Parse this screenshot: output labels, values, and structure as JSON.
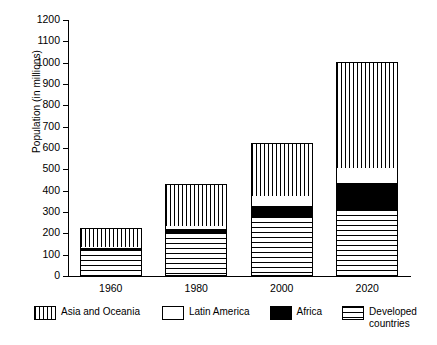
{
  "chart_data": {
    "type": "bar",
    "stacked": true,
    "title": "",
    "xlabel": "",
    "ylabel": "Population (in millions)",
    "categories": [
      "1960",
      "1980",
      "2000",
      "2020"
    ],
    "ylim": [
      0,
      1200
    ],
    "ytick_step": 100,
    "yticks": [
      0,
      100,
      200,
      300,
      400,
      500,
      600,
      700,
      800,
      900,
      1000,
      1100,
      1200
    ],
    "grid": false,
    "legend_position": "bottom",
    "series": [
      {
        "name": "Developed countries",
        "pattern": "horizontal-lines",
        "values": [
          120,
          200,
          275,
          310
        ]
      },
      {
        "name": "Africa",
        "pattern": "solid-black",
        "values": [
          10,
          20,
          55,
          125
        ]
      },
      {
        "name": "Latin America",
        "pattern": "white-empty",
        "values": [
          5,
          15,
          45,
          70
        ]
      },
      {
        "name": "Asia and Oceania",
        "pattern": "vertical-lines",
        "values": [
          90,
          195,
          250,
          500
        ]
      }
    ],
    "totals": [
      225,
      430,
      625,
      1005
    ]
  },
  "axis": {
    "y_title": "Population (in millions)",
    "y_tick_labels": [
      "1200",
      "1100",
      "1000",
      "900",
      "800",
      "700",
      "600",
      "500",
      "400",
      "300",
      "200",
      "100",
      "0"
    ],
    "x_tick_labels": [
      "1960",
      "1980",
      "2000",
      "2020"
    ]
  },
  "legend": {
    "items": [
      {
        "label": "Asia and Oceania",
        "pattern": "vertical-lines"
      },
      {
        "label": "Latin America",
        "pattern": "white-empty"
      },
      {
        "label": "Africa",
        "pattern": "solid-black"
      },
      {
        "label": "Developed\ncountries",
        "pattern": "horizontal-lines"
      }
    ]
  },
  "colors": {
    "ink": "#000000",
    "paper": "#ffffff"
  }
}
